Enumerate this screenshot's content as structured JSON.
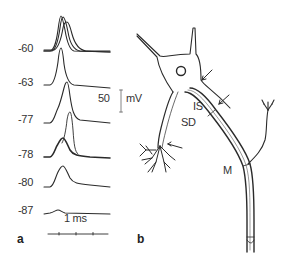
{
  "panel_a": {
    "label": "a",
    "traces": [
      {
        "voltage": "-60"
      },
      {
        "voltage": "-63"
      },
      {
        "voltage": "-77"
      },
      {
        "voltage": "-78"
      },
      {
        "voltage": "-80"
      },
      {
        "voltage": "-87"
      }
    ],
    "scale_bar_voltage_value": "50",
    "scale_bar_voltage_unit": "mV",
    "scale_bar_time": "1 ms"
  },
  "panel_b": {
    "label": "b",
    "regions": {
      "initial_segment": "IS",
      "soma_dendritic": "SD",
      "myelinated": "M"
    }
  },
  "colors": {
    "ink": "#2a2a2a",
    "background": "#ffffff"
  }
}
